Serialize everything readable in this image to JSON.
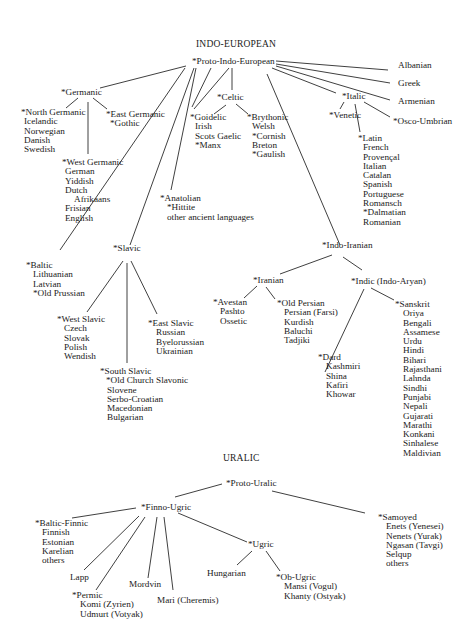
{
  "sections": {
    "indo_european": "INDO-EUROPEAN",
    "uralic": "URALIC"
  },
  "ie": {
    "root": "*Proto-Indo-European",
    "albanian": "Albanian",
    "greek": "Greek",
    "armenian": "Armenian",
    "germanic": "*Germanic",
    "north_germanic": {
      "head": "*North Germanic",
      "items": [
        "Icelandic",
        "Norwegian",
        "Danish",
        "Swedish"
      ]
    },
    "east_germanic": {
      "head": "*East Germanic",
      "items": [
        "*Gothic"
      ]
    },
    "west_germanic": {
      "head": "*West Germanic",
      "items": [
        "German",
        "Yiddish",
        "Dutch",
        "Afrikaans",
        "Frisian",
        "English"
      ]
    },
    "celtic": "*Celtic",
    "goidelic": {
      "head": "*Goidelic",
      "items": [
        "Irish",
        "Scots Gaelic",
        "*Manx"
      ]
    },
    "brythonic": {
      "head": "*Brythonic",
      "items": [
        "Welsh",
        "*Cornish",
        "Breton",
        "*Gaulish"
      ]
    },
    "italic": "*Italic",
    "venetic": "*Venetic",
    "osco_umbrian": "*Osco-Umbrian",
    "latin": {
      "head": "*Latin",
      "items": [
        "French",
        "Provençal",
        "Italian",
        "Catalan",
        "Spanish",
        "Portuguese",
        "Romansch",
        "*Dalmatian",
        "Romanian"
      ]
    },
    "anatolian": {
      "head": "*Anatolian",
      "items": [
        "*Hittite",
        "other ancient languages"
      ]
    },
    "baltic": {
      "head": "*Baltic",
      "items": [
        "Lithuanian",
        "Latvian",
        "*Old Prussian"
      ]
    },
    "slavic": "*Slavic",
    "west_slavic": {
      "head": "*West Slavic",
      "items": [
        "Czech",
        "Slovak",
        "Polish",
        "Wendish"
      ]
    },
    "east_slavic": {
      "head": "*East Slavic",
      "items": [
        "Russian",
        "Byelorussian",
        "Ukrainian"
      ]
    },
    "south_slavic": {
      "head": "*South Slavic",
      "items": [
        "*Old Church Slavonic",
        "Slovene",
        "Serbo-Croatian",
        "Macedonian",
        "Bulgarian"
      ]
    },
    "indo_iranian": "*Indo-Iranian",
    "iranian": "*Iranian",
    "avestan": {
      "head": "*Avestan",
      "items": [
        "Pashto",
        "Ossetic"
      ]
    },
    "old_persian": {
      "head": "*Old Persian",
      "items": [
        "Persian (Farsi)",
        "Kurdish",
        "Baluchi",
        "Tadjiki"
      ]
    },
    "indic": "*Indic (Indo-Aryan)",
    "dard": {
      "head": "*Dard",
      "items": [
        "Kashmiri",
        "Shina",
        "Kafiri",
        "Khowar"
      ]
    },
    "sanskrit": {
      "head": "*Sanskrit",
      "items": [
        "Oriya",
        "Bengali",
        "Assamese",
        "Urdu",
        "Hindi",
        "Bihari",
        "Rajasthani",
        "Lahnda",
        "Sindhi",
        "Punjabi",
        "Nepali",
        "Gujarati",
        "Marathi",
        "Konkani",
        "Sinhalese",
        "Maldivian"
      ]
    }
  },
  "uralic": {
    "root": "*Proto-Uralic",
    "finno_ugric": "*Finno-Ugric",
    "baltic_finnic": {
      "head": "*Baltic-Finnic",
      "items": [
        "Finnish",
        "Estonian",
        "Karelian",
        "others"
      ]
    },
    "lapp": "Lapp",
    "permic": {
      "head": "*Permic",
      "items": [
        "Komi (Zyrien)",
        "Udmurt (Votyak)"
      ]
    },
    "mordvin": "Mordvin",
    "mari": "Mari (Cheremis)",
    "ugric": "*Ugric",
    "hungarian": "Hungarian",
    "ob_ugric": {
      "head": "*Ob-Ugric",
      "items": [
        "Mansi (Vogul)",
        "Khanty (Ostyak)"
      ]
    },
    "samoyed": {
      "head": "*Samoyed",
      "items": [
        "Enets (Yenesei)",
        "Nenets (Yurak)",
        "Ngasan (Tavgi)",
        "Selqup",
        "others"
      ]
    }
  }
}
